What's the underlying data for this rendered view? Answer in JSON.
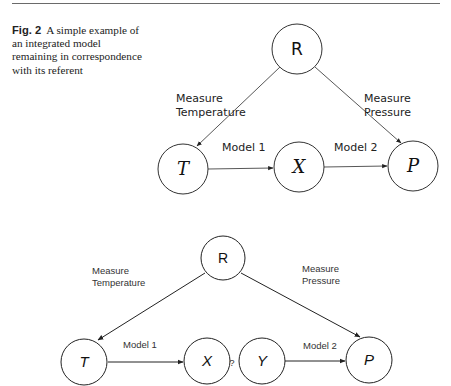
{
  "caption": {
    "figure_label": "Fig. 2",
    "text": "A simple example of an integrated model remaining in correspondence with its referent"
  },
  "diagram_top": {
    "nodes": {
      "R": "R",
      "T": "T",
      "X": "X",
      "P": "P"
    },
    "edges": {
      "measure_temperature": [
        "Measure",
        "Temperature"
      ],
      "measure_pressure": [
        "Measure",
        "Pressure"
      ],
      "model1": "Model 1",
      "model2": "Model 2"
    }
  },
  "diagram_bottom": {
    "nodes": {
      "R": "R",
      "T": "T",
      "X": "X",
      "Y": "Y",
      "P": "P"
    },
    "unknown_link": "?",
    "edges": {
      "measure_temperature": [
        "Measure",
        "Temperature"
      ],
      "measure_pressure": [
        "Measure",
        "Pressure"
      ],
      "model1": "Model 1",
      "model2": "Model 2"
    }
  }
}
